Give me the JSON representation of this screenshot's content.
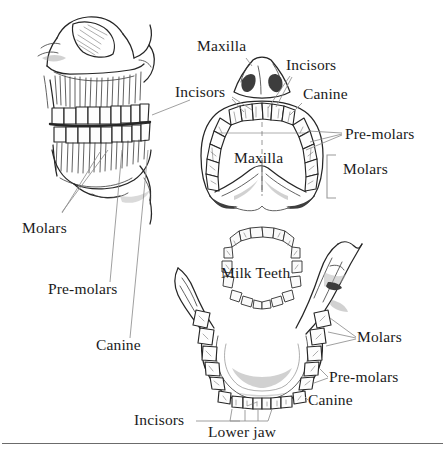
{
  "figure": {
    "background_color": "#ffffff",
    "ink_color": "#1b1b1b",
    "leader_color": "#8a8a8a",
    "rule_color": "#6b6b6b"
  },
  "labels": {
    "maxilla_top": "Maxilla",
    "incisors_left": "Incisors",
    "incisors_right": "Incisors",
    "canine_upper": "Canine",
    "pre_molars_upper": "Pre-molars",
    "molars_upper": "Molars",
    "maxilla_inner": "Maxilla",
    "molars_left": "Molars",
    "pre_molars_left": "Pre-molars",
    "canine_left": "Canine",
    "milk_teeth": "Milk Teeth",
    "molars_lower": "Molars",
    "pre_molars_lower": "Pre-molars",
    "canine_lower": "Canine",
    "incisors_lower": "Incisors",
    "lower_jaw": "Lower jaw"
  },
  "panels": {
    "skull": "lateral-skull-with-teeth",
    "maxilla_arch": "upper-dental-arch-maxilla",
    "mandible_arch": "lower-dental-arch-mandible",
    "milk_teeth_arch": "deciduous-teeth-arch"
  }
}
